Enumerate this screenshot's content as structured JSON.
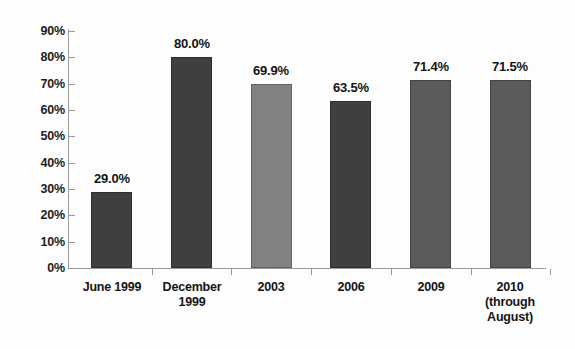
{
  "chart_data": {
    "type": "bar",
    "title": "",
    "subtitle": "",
    "xlabel": "",
    "ylabel": "",
    "ylim": [
      0,
      90
    ],
    "ytick_step": 10,
    "grid": false,
    "legend": "none",
    "y_ticks": [
      "0%",
      "10%",
      "20%",
      "30%",
      "40%",
      "50%",
      "60%",
      "70%",
      "80%",
      "90%"
    ],
    "categories": [
      "June 1999",
      "December 1999",
      "2003",
      "2006",
      "2009",
      "2010 (through August)"
    ],
    "category_lines": [
      [
        "June 1999"
      ],
      [
        "December",
        "1999"
      ],
      [
        "2003"
      ],
      [
        "2006"
      ],
      [
        "2009"
      ],
      [
        "2010",
        "(through",
        "August)"
      ]
    ],
    "values": [
      29.0,
      80.0,
      69.9,
      63.5,
      71.4,
      71.5
    ],
    "value_labels": [
      "29.0%",
      "80.0%",
      "69.9%",
      "63.5%",
      "71.4%",
      "71.5%"
    ],
    "bar_colors": [
      "#3f3f3f",
      "#3f3f3f",
      "#828282",
      "#3f3f3f",
      "#5b5b5b",
      "#5b5b5b"
    ],
    "axis_color": "#9a9a9a",
    "background_color": "#fdfdfd",
    "text_color": "#141414"
  }
}
